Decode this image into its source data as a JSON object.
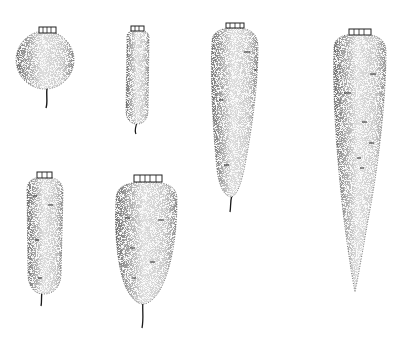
{
  "figure": {
    "style": "black-and-white stippled line illustration",
    "background_color": "#ffffff",
    "ink_color": "#1a1a1a",
    "roots": [
      {
        "id": "round",
        "description": "Round / globe-shaped root"
      },
      {
        "id": "short-cylindrical",
        "description": "Short slender cylindrical root"
      },
      {
        "id": "long-tapered",
        "description": "Long tapering root"
      },
      {
        "id": "very-long-conical",
        "description": "Very long pointed conical root"
      },
      {
        "id": "medium-cylindrical",
        "description": "Medium cylindrical blunt root"
      },
      {
        "id": "broad-conical",
        "description": "Broad-shouldered conical root"
      }
    ]
  }
}
